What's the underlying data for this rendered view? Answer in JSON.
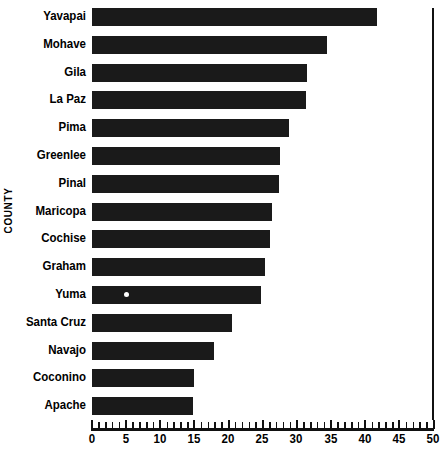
{
  "chart_data": {
    "type": "bar",
    "orientation": "horizontal",
    "title": "",
    "xlabel": "",
    "ylabel": "COUNTY",
    "xlim": [
      0,
      50
    ],
    "xticks": [
      0,
      5,
      10,
      15,
      20,
      25,
      30,
      35,
      40,
      45,
      50
    ],
    "xtick_labels": [
      "0",
      "5",
      "10",
      "15",
      "20",
      "25",
      "30",
      "35",
      "40",
      "45",
      "50"
    ],
    "minor_tick_step": 1,
    "grid": false,
    "legend": null,
    "bar_color": "#1a1a1a",
    "categories": [
      "Yavapai",
      "Mohave",
      "Gila",
      "La Paz",
      "Pima",
      "Greenlee",
      "Pinal",
      "Maricopa",
      "Cochise",
      "Graham",
      "Yuma",
      "Santa Cruz",
      "Navajo",
      "Coconino",
      "Apache"
    ],
    "values": [
      41.8,
      34.5,
      31.5,
      31.4,
      28.9,
      27.6,
      27.4,
      26.4,
      26.2,
      25.4,
      24.8,
      20.5,
      17.9,
      15.0,
      14.8
    ],
    "annotations": [
      {
        "category": "Yuma",
        "marker": "white-dot",
        "x": 4.7
      }
    ]
  },
  "axis": {
    "y_title": "COUNTY"
  }
}
